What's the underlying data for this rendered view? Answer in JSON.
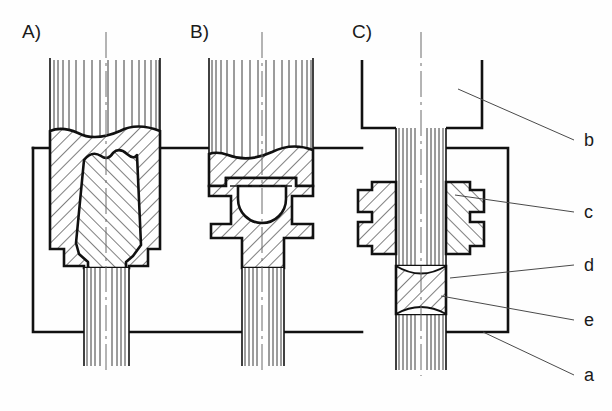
{
  "figure": {
    "background_color": "#fefefe",
    "ink_color": "#111111",
    "leader_color": "#4a4a4a",
    "width": 612,
    "height": 411
  },
  "panels": [
    {
      "id": "A",
      "label": "A)",
      "x": 22,
      "y": 38,
      "description": "Upset billet with barrelled preform between dies"
    },
    {
      "id": "B",
      "label": "B)",
      "x": 190,
      "y": 38,
      "description": "Partially formed part with cavity and die cheeks"
    },
    {
      "id": "C",
      "label": "C)",
      "x": 352,
      "y": 38,
      "description": "Finished slender shaft through split die with flash"
    }
  ],
  "callouts": [
    {
      "key": "b",
      "label": "b",
      "label_x": 584,
      "label_y": 146,
      "leader": [
        [
          458,
          89
        ],
        [
          574,
          140
        ]
      ],
      "meaning": "billet-upper-stock"
    },
    {
      "key": "c",
      "label": "c",
      "label_x": 584,
      "label_y": 218,
      "leader": [
        [
          455,
          195
        ],
        [
          574,
          212
        ]
      ],
      "meaning": "die-insert"
    },
    {
      "key": "d",
      "label": "d",
      "label_x": 584,
      "label_y": 271,
      "leader": [
        [
          450,
          278
        ],
        [
          574,
          265
        ]
      ],
      "meaning": "flash-burr"
    },
    {
      "key": "e",
      "label": "e",
      "label_x": 584,
      "label_y": 326,
      "leader": [
        [
          441,
          296
        ],
        [
          574,
          320
        ]
      ],
      "meaning": "workpiece-shaft"
    },
    {
      "key": "a",
      "label": "a",
      "label_x": 584,
      "label_y": 381,
      "leader": [
        [
          483,
          332
        ],
        [
          574,
          375
        ]
      ],
      "meaning": "press-frame-bolster"
    }
  ],
  "frame": {
    "name": "press-bolster-frame",
    "left": 33,
    "right": 508,
    "top": 148,
    "bottom": 332
  }
}
